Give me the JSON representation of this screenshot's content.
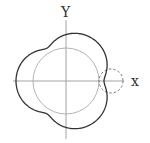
{
  "diagram": {
    "axes": {
      "x_label": "x",
      "y_label": "Y",
      "origin_px": [
        66,
        81
      ],
      "x_range_px": [
        13,
        124
      ],
      "y_range_px": [
        18,
        139
      ]
    },
    "fixed_circle": {
      "radius_px": 33,
      "color": "#aaaaaa"
    },
    "rolling_circle": {
      "radius_px": 12,
      "center_px": [
        111,
        81
      ],
      "style": "dashed",
      "color": "#666666"
    },
    "curve": {
      "type": "epitrochoid",
      "R": 33,
      "r": 11,
      "d": 6,
      "lobes": 3,
      "color": "#333333",
      "max_radius_px": 50,
      "min_radius_px": 38
    },
    "colors": {
      "axis": "#999999",
      "curve": "#333333",
      "fixed_circle": "#aaaaaa",
      "rolling_circle": "#666666"
    }
  }
}
